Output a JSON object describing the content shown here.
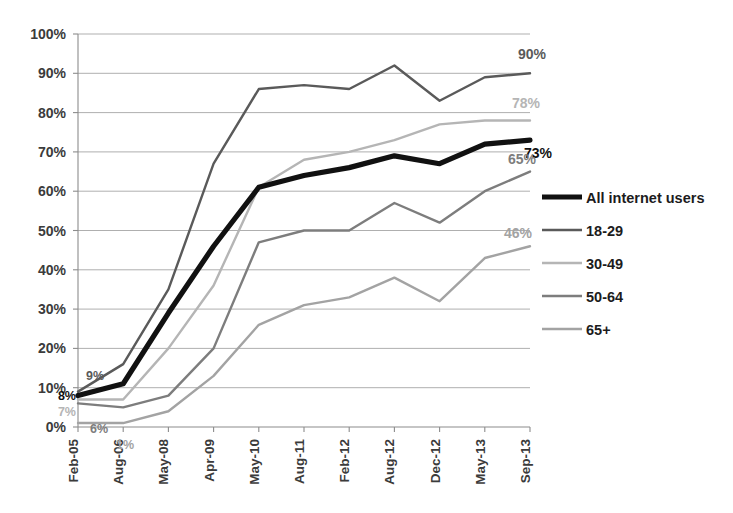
{
  "chart_data": {
    "type": "line",
    "title": "",
    "subtitle": "",
    "xlabel": "",
    "ylabel": "",
    "x": [
      "Feb-05",
      "Aug-06",
      "May-08",
      "Apr-09",
      "May-10",
      "Aug-11",
      "Feb-12",
      "Aug-12",
      "Dec-12",
      "May-13",
      "Sep-13"
    ],
    "ylim": [
      0,
      100
    ],
    "yticks": [
      0,
      10,
      20,
      30,
      40,
      50,
      60,
      70,
      80,
      90,
      100
    ],
    "ytick_labels": [
      "0%",
      "10%",
      "20%",
      "30%",
      "40%",
      "50%",
      "60%",
      "70%",
      "80%",
      "90%",
      "100%"
    ],
    "grid": true,
    "legend_position": "right",
    "series": [
      {
        "name": "All internet users",
        "color": "#111111",
        "width": 5.2,
        "values": [
          8,
          11,
          29,
          46,
          61,
          64,
          66,
          69,
          67,
          72,
          73
        ],
        "start_label": "8%",
        "end_label": "73%"
      },
      {
        "name": "18-29",
        "color": "#5a5a5a",
        "width": 2.4,
        "values": [
          9,
          16,
          35,
          67,
          86,
          87,
          86,
          92,
          83,
          89,
          90
        ],
        "start_label": "9%",
        "end_label": "90%"
      },
      {
        "name": "30-49",
        "color": "#b5b5b5",
        "width": 2.4,
        "values": [
          7,
          7,
          20,
          36,
          61,
          68,
          70,
          73,
          77,
          78,
          78
        ],
        "start_label": "7%",
        "end_label": "78%"
      },
      {
        "name": "50-64",
        "color": "#7d7d7d",
        "width": 2.4,
        "values": [
          6,
          5,
          8,
          20,
          47,
          50,
          50,
          57,
          52,
          60,
          65
        ],
        "start_label": "6%",
        "end_label": "65%"
      },
      {
        "name": "65+",
        "color": "#a3a3a3",
        "width": 2.4,
        "values": [
          1,
          1,
          4,
          13,
          26,
          31,
          33,
          38,
          32,
          43,
          46
        ],
        "start_label": "1%",
        "end_label": "46%"
      }
    ]
  },
  "legend": {
    "items": [
      {
        "label": "All internet users"
      },
      {
        "label": "18-29"
      },
      {
        "label": "30-49"
      },
      {
        "label": "50-64"
      },
      {
        "label": "65+"
      }
    ]
  },
  "colors": {
    "all_internet_users": "#111111",
    "age_18_29": "#5a5a5a",
    "age_30_49": "#b5b5b5",
    "age_50_64": "#7d7d7d",
    "age_65_plus": "#a3a3a3",
    "gridline": "#a6a6a6",
    "axis": "#8c8c8c",
    "background": "#ffffff"
  }
}
